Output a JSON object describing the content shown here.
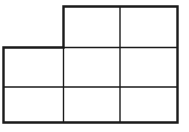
{
  "figure": {
    "canvas": {
      "width": 189,
      "height": 132
    },
    "background_color": "#ffffff",
    "line_color": "#1a1a1a",
    "outer_stroke_width": 2.4,
    "inner_stroke_width": 1.4,
    "outline_points": [
      [
        63.5,
        6.5
      ],
      [
        177.5,
        6.5
      ],
      [
        177.5,
        122.5
      ],
      [
        3.5,
        122.5
      ],
      [
        3.5,
        47.5
      ],
      [
        63.5,
        47.5
      ]
    ],
    "inner_lines": [
      {
        "name": "vertical-divider-left",
        "x1": 63.5,
        "y1": 47.5,
        "x2": 63.5,
        "y2": 122.5
      },
      {
        "name": "vertical-divider-right",
        "x1": 120.0,
        "y1": 6.5,
        "x2": 120.0,
        "y2": 122.5
      },
      {
        "name": "horizontal-divider-upper",
        "x1": 63.5,
        "y1": 47.5,
        "x2": 177.5,
        "y2": 47.5
      },
      {
        "name": "horizontal-divider-lower",
        "x1": 3.5,
        "y1": 87.0,
        "x2": 177.5,
        "y2": 87.0
      }
    ],
    "grid": {
      "columns": 3,
      "rows": 3,
      "missing_cells": [
        "row1-col1"
      ],
      "cell_count": 8,
      "column_edges_x": [
        3.5,
        63.5,
        120.0,
        177.5
      ],
      "row_edges_y": [
        6.5,
        47.5,
        87.0,
        122.5
      ]
    }
  }
}
